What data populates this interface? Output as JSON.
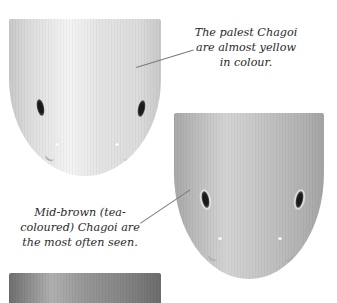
{
  "captions": {
    "pale": {
      "line1": "The palest Chagoi",
      "line2": "are almost yellow",
      "line3": "in colour."
    },
    "mid_brown": {
      "line1": "Mid-brown (tea-",
      "line2": "coloured) Chagoi are",
      "line3": "the most often seen."
    }
  },
  "illustrations": [
    {
      "name": "pale-chagoi",
      "tone": "#e2e2e2"
    },
    {
      "name": "mid-brown-chagoi",
      "tone": "#b8b8b8"
    },
    {
      "name": "dark-chagoi",
      "tone": "#8a8a8a"
    }
  ]
}
